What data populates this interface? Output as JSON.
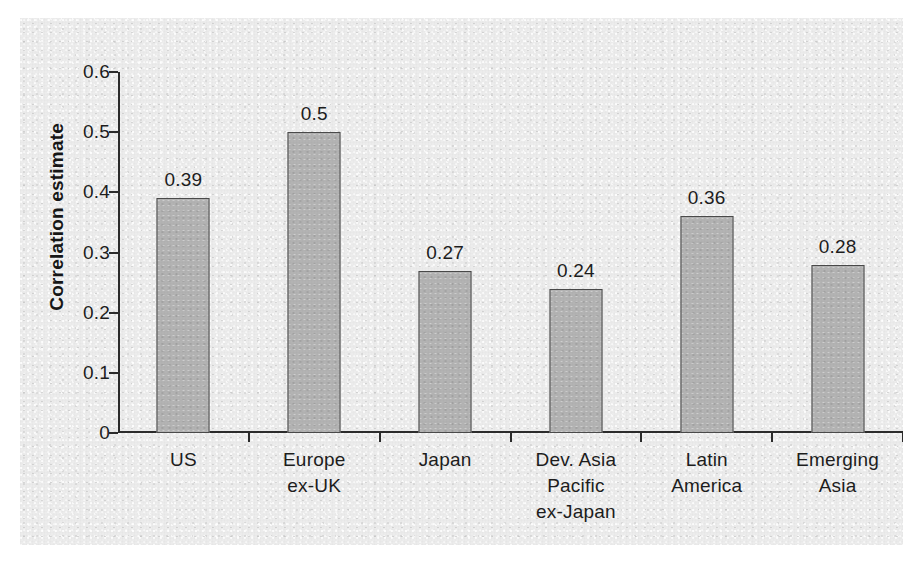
{
  "chart_data": {
    "type": "bar",
    "title": "",
    "xlabel": "",
    "ylabel": "Correlation estimate",
    "categories": [
      "US",
      "Europe\nex-UK",
      "Japan",
      "Dev. Asia\nPacific\nex-Japan",
      "Latin\nAmerica",
      "Emerging\nAsia"
    ],
    "values": [
      0.39,
      0.5,
      0.27,
      0.24,
      0.36,
      0.28
    ],
    "value_labels": [
      "0.39",
      "0.5",
      "0.27",
      "0.24",
      "0.36",
      "0.28"
    ],
    "ylim": [
      0,
      0.6
    ],
    "yticks": [
      0,
      0.1,
      0.2,
      0.3,
      0.4,
      0.5,
      0.6
    ],
    "ytick_labels": [
      "0",
      "0.1",
      "0.2",
      "0.3",
      "0.4",
      "0.5",
      "0.6"
    ],
    "grid": false,
    "legend": null,
    "bar_color": "#b3b3b3",
    "bar_edge_color": "#4a4a4a",
    "axis_color": "#2b2b2b",
    "background_color": "#ececec",
    "text_color": "#1d1d1d"
  }
}
